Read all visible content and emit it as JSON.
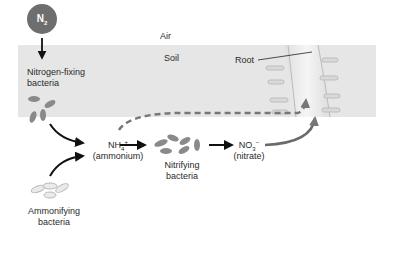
{
  "diagram": {
    "regions": {
      "air": "Air",
      "soil": "Soil"
    },
    "molecule_n2": {
      "base": "N",
      "sub": "2"
    },
    "labels": {
      "nitrogen_fixing": [
        "Nitrogen-fixing",
        "bacteria"
      ],
      "ammonifying": [
        "Ammonifying",
        "bacteria"
      ],
      "nitrifying": [
        "Nitrifying",
        "bacteria"
      ],
      "ammonium_formula": {
        "base": "NH",
        "sub": "4",
        "sup": "+"
      },
      "ammonium_name": "(ammonium)",
      "nitrate_formula": {
        "base": "NO",
        "sub": "3",
        "sup": "−"
      },
      "nitrate_name": "(nitrate)",
      "root": "Root"
    },
    "colors": {
      "soil": "#e6e6e6",
      "bacteria": "#8a8a8a",
      "ammonifying_outline": "#b8b8b8",
      "root": "#efefef",
      "root_outline": "#bdbdbd",
      "arrow": "#111111",
      "dashed_arrow": "#7a7a7a",
      "n2_circle": "#6e6e6e"
    }
  }
}
